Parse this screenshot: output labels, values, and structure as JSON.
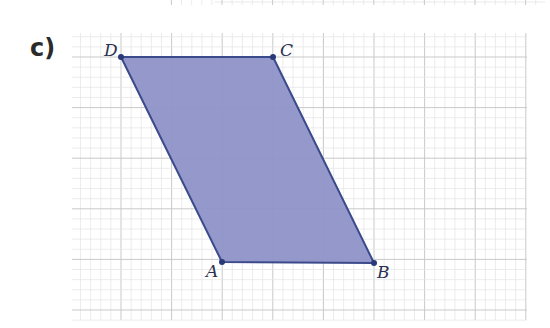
{
  "part_label": "c)",
  "shape": {
    "type": "parallelogram",
    "fill": "#8E92C8",
    "stroke": "#3A4A8A",
    "vertices": [
      {
        "name": "A",
        "x": 222,
        "y": 262
      },
      {
        "name": "B",
        "x": 374,
        "y": 263
      },
      {
        "name": "C",
        "x": 273,
        "y": 57
      },
      {
        "name": "D",
        "x": 121,
        "y": 57
      }
    ]
  },
  "labels": {
    "A": "A",
    "B": "B",
    "C": "C",
    "D": "D"
  },
  "grid": {
    "x0": 72,
    "x1": 527,
    "y0": 33,
    "y1": 320,
    "major": 50.6,
    "minor_divisions": 5,
    "major_color": "#c9c9c9",
    "minor_color": "#e4e4e4"
  }
}
